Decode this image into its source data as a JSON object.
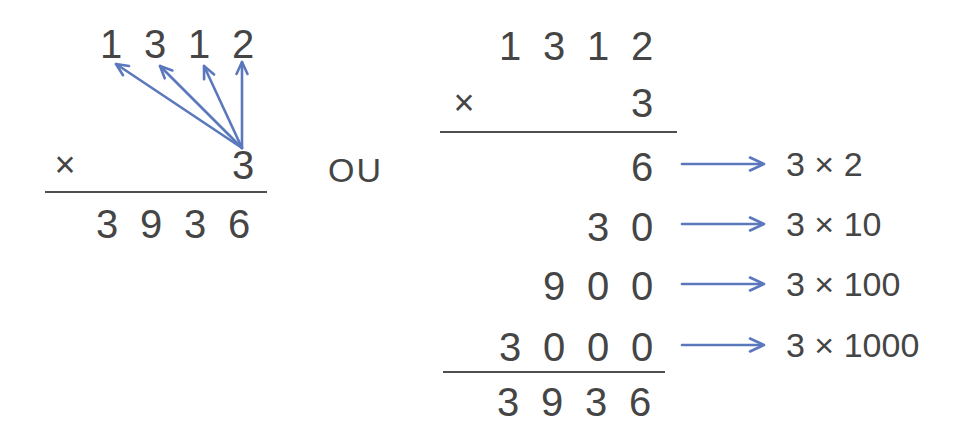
{
  "colors": {
    "background": "#ffffff",
    "text": "#454545",
    "rule": "#4f4f4f",
    "arrow": "#5b78bd"
  },
  "connector": {
    "label": "OU"
  },
  "left_method": {
    "multiplicand": {
      "digits": [
        "1",
        "3",
        "1",
        "2"
      ]
    },
    "times_sign": "×",
    "multiplier": "3",
    "product": {
      "digits": [
        "3",
        "9",
        "3",
        "6"
      ]
    }
  },
  "right_method": {
    "multiplicand": {
      "digits": [
        "1",
        "3",
        "1",
        "2"
      ]
    },
    "times_sign": "×",
    "multiplier": "3",
    "partial_products": [
      {
        "digits": [
          "",
          "",
          "",
          "6"
        ],
        "label": "3 × 2"
      },
      {
        "digits": [
          "",
          "",
          "3",
          "0"
        ],
        "label": "3 × 10"
      },
      {
        "digits": [
          "",
          "9",
          "0",
          "0"
        ],
        "label": "3 × 100"
      },
      {
        "digits": [
          "3",
          "0",
          "0",
          "0"
        ],
        "label": "3 × 1000"
      }
    ],
    "product": {
      "digits": [
        "3",
        "9",
        "3",
        "6"
      ]
    }
  }
}
